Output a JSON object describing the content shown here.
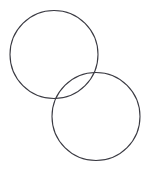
{
  "canvas": {
    "width": 148,
    "height": 175,
    "background_color": "#ffffff",
    "description": "Two overlapping unfilled circle outlines arranged diagonally"
  },
  "style": {
    "stroke_color": "#3a3a42",
    "stroke_width": 1.1,
    "fill": "none"
  },
  "shapes": [
    {
      "name": "upper-left-circle",
      "type": "circle",
      "cx": 54,
      "cy": 54.5,
      "r": 44,
      "stroke_color": "#3a3a42",
      "stroke_width": 1.1,
      "fill": "none"
    },
    {
      "name": "lower-right-circle",
      "type": "circle",
      "cx": 96,
      "cy": 116.5,
      "r": 44,
      "stroke_color": "#3a3a42",
      "stroke_width": 1.1,
      "fill": "none"
    }
  ],
  "geometry": {
    "intersection_points": [
      {
        "x": 96,
        "y": 71
      },
      {
        "x": 54,
        "y": 98
      }
    ],
    "overlap": true,
    "labels": []
  }
}
